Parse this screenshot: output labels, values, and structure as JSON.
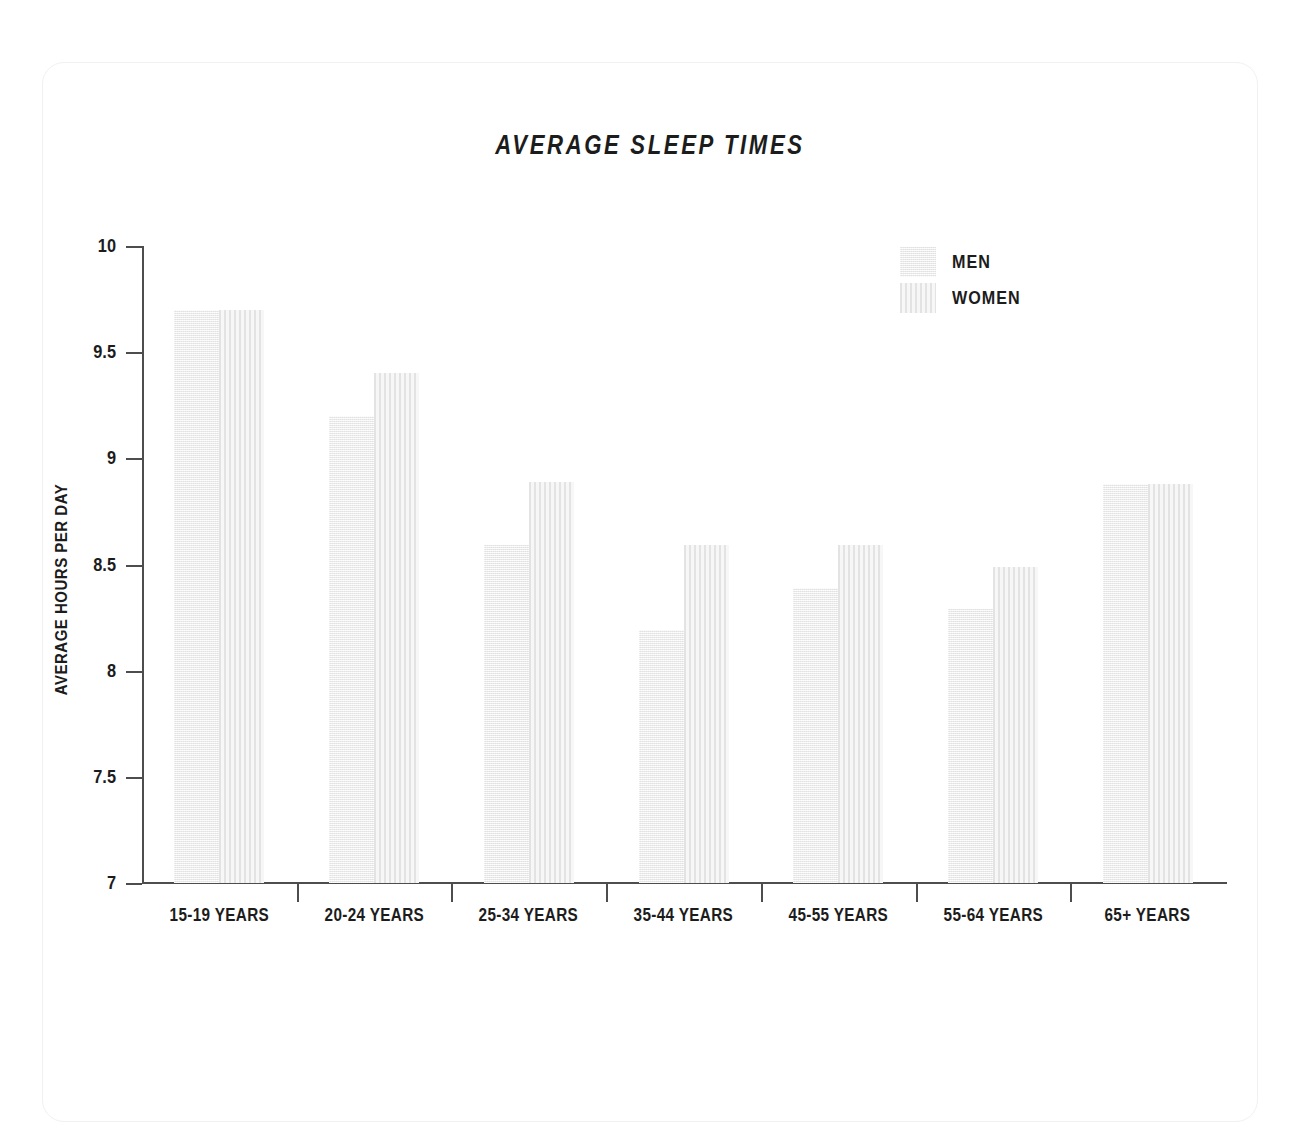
{
  "chart_data": {
    "type": "bar",
    "title": "AVERAGE SLEEP TIMES",
    "xlabel": "",
    "ylabel": "AVERAGE HOURS PER DAY",
    "ylim": [
      7,
      10
    ],
    "yticks": [
      "7",
      "7.5",
      "8",
      "8.5",
      "9",
      "9.5",
      "10"
    ],
    "grid": false,
    "legend_position": "top-right",
    "categories": [
      "15-19 YEARS",
      "20-24 YEARS",
      "25-34 YEARS",
      "35-44 YEARS",
      "45-55 YEARS",
      "55-64 YEARS",
      "65+ YEARS"
    ],
    "series": [
      {
        "name": "MEN",
        "values": [
          9.7,
          9.2,
          8.59,
          8.19,
          8.39,
          8.29,
          8.88
        ]
      },
      {
        "name": "WOMEN",
        "values": [
          9.7,
          9.4,
          8.89,
          8.59,
          8.59,
          8.49,
          8.88
        ]
      }
    ]
  },
  "legend": {
    "items": [
      {
        "label": "MEN",
        "swatch": "men"
      },
      {
        "label": "WOMEN",
        "swatch": "women"
      }
    ]
  },
  "colors": {
    "men_bar": "#ededed",
    "women_bar": "#e3e3e3",
    "axis": "#4d4d4d",
    "text": "#1c1c1c",
    "card_border": "#f1f1f1",
    "background": "#ffffff"
  }
}
